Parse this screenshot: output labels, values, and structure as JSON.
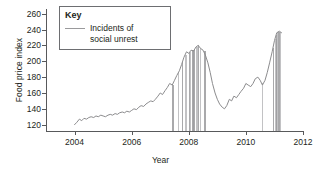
{
  "chart_data": {
    "type": "line",
    "title": "",
    "xlabel": "Year",
    "ylabel": "Food price index",
    "xlim": [
      2003.0,
      2012.0
    ],
    "ylim": [
      112,
      266
    ],
    "grid": false,
    "legend_position": "top-left",
    "xticks": [
      2004,
      2006,
      2008,
      2010,
      2012
    ],
    "yticks": [
      120,
      140,
      160,
      180,
      200,
      220,
      240,
      260
    ],
    "series": [
      {
        "name": "Food price index",
        "color": "#8c8c8e",
        "x": [
          2004.0,
          2004.08,
          2004.17,
          2004.25,
          2004.33,
          2004.42,
          2004.5,
          2004.58,
          2004.67,
          2004.75,
          2004.83,
          2004.92,
          2005.0,
          2005.08,
          2005.17,
          2005.25,
          2005.33,
          2005.42,
          2005.5,
          2005.58,
          2005.67,
          2005.75,
          2005.83,
          2005.92,
          2006.0,
          2006.08,
          2006.17,
          2006.25,
          2006.33,
          2006.42,
          2006.5,
          2006.58,
          2006.67,
          2006.75,
          2006.83,
          2006.92,
          2007.0,
          2007.08,
          2007.17,
          2007.25,
          2007.33,
          2007.42,
          2007.5,
          2007.58,
          2007.67,
          2007.75,
          2007.83,
          2007.92,
          2008.0,
          2008.08,
          2008.17,
          2008.25,
          2008.33,
          2008.42,
          2008.5,
          2008.58,
          2008.67,
          2008.75,
          2008.83,
          2008.92,
          2009.0,
          2009.08,
          2009.17,
          2009.25,
          2009.33,
          2009.42,
          2009.5,
          2009.58,
          2009.67,
          2009.75,
          2009.83,
          2009.92,
          2010.0,
          2010.08,
          2010.17,
          2010.25,
          2010.33,
          2010.42,
          2010.5,
          2010.58,
          2010.67,
          2010.75,
          2010.83,
          2010.92,
          2011.0,
          2011.08,
          2011.17,
          2011.25
        ],
        "y": [
          120,
          123,
          127,
          125,
          128,
          127,
          129,
          130,
          129,
          131,
          130,
          132,
          131,
          130,
          132,
          133,
          132,
          134,
          133,
          135,
          136,
          135,
          137,
          136,
          138,
          140,
          139,
          142,
          144,
          143,
          146,
          148,
          150,
          149,
          152,
          156,
          160,
          158,
          163,
          167,
          172,
          170,
          176,
          182,
          188,
          196,
          205,
          212,
          210,
          214,
          213,
          218,
          220,
          216,
          214,
          208,
          198,
          186,
          172,
          160,
          152,
          146,
          142,
          140,
          144,
          152,
          150,
          156,
          154,
          158,
          162,
          166,
          172,
          170,
          168,
          172,
          178,
          180,
          176,
          170,
          176,
          186,
          198,
          212,
          226,
          236,
          238,
          236
        ]
      }
    ],
    "unrest_markers": {
      "label": "Incidents of social unrest",
      "color": "#9a9a9c",
      "x": [
        2007.42,
        2007.62,
        2007.78,
        2007.86,
        2008.0,
        2008.04,
        2008.1,
        2008.14,
        2008.2,
        2008.26,
        2008.33,
        2008.4,
        2008.52,
        2010.55,
        2010.95,
        2011.02,
        2011.06,
        2011.1,
        2011.14,
        2011.2
      ]
    }
  },
  "legend": {
    "title": "Key",
    "entry_label_line1": "Incidents of",
    "entry_label_line2": "social unrest"
  },
  "axis_labels": {
    "x": "Year",
    "y": "Food price index"
  }
}
